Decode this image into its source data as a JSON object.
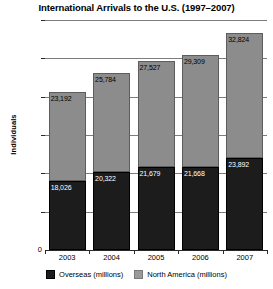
{
  "chart_data": {
    "type": "bar",
    "stacked": true,
    "title": "International Arrivals to the U.S. (1997–2007)",
    "xlabel": "",
    "ylabel": "Individuals",
    "categories": [
      "2003",
      "2004",
      "2005",
      "2006",
      "2007"
    ],
    "ylim": [
      0,
      60000
    ],
    "yticks": [
      0,
      10000,
      20000,
      30000,
      40000,
      50000,
      60000
    ],
    "ytick_labels": [
      "0",
      "10,000",
      "20,000",
      "30,000",
      "40,000",
      "50,000",
      "60,000"
    ],
    "grid": true,
    "legend_position": "bottom",
    "series": [
      {
        "name": "Overseas (millions)",
        "color": "#1c1c1c",
        "values": [
          18026,
          20322,
          21679,
          21668,
          23892
        ],
        "value_labels": [
          "18,026",
          "20,322",
          "21,679",
          "21,668",
          "23,892"
        ]
      },
      {
        "name": "North America (millions)",
        "color": "#8c8c8c",
        "values": [
          23192,
          25784,
          27527,
          29309,
          32824
        ],
        "value_labels": [
          "23,192",
          "25,784",
          "27,527",
          "29,309",
          "32,824"
        ]
      }
    ],
    "totals": [
      41218,
      46106,
      49206,
      50977,
      56716
    ]
  }
}
